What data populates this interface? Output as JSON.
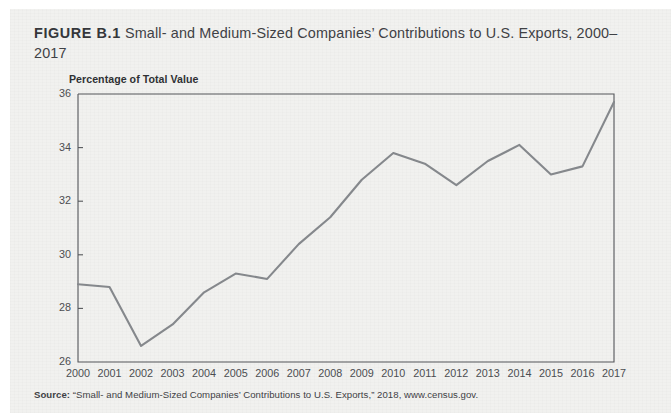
{
  "figure": {
    "number_label": "FIGURE B.1",
    "caption_text": "Small- and Medium-Sized Companies’ Contributions to U.S. Exports, 2000–2017",
    "source_label": "Source:",
    "source_text": "“Small- and Medium-Sized Companies’ Contributions to U.S. Exports,” 2018, www.census.gov."
  },
  "colors": {
    "page_background": "#f1f1ef",
    "line": "#85888c",
    "frame": "#55575b",
    "text": "#3f4145",
    "tick_text": "#4b4d51"
  },
  "chart_data": {
    "type": "line",
    "title": "Small- and Medium-Sized Companies’ Contributions to U.S. Exports, 2000–2017",
    "xlabel": "",
    "ylabel": "Percentage of Total Value",
    "axis_title": "Percentage of Total Value",
    "grid": false,
    "legend": "none",
    "xlim": [
      2000,
      2017
    ],
    "ylim": [
      26,
      36
    ],
    "ytick_step": 2,
    "ytick_labels": [
      "26",
      "28",
      "30",
      "32",
      "34",
      "36"
    ],
    "yticks": [
      26,
      28,
      30,
      32,
      34,
      36
    ],
    "categories": [
      "2000",
      "2001",
      "2002",
      "2003",
      "2004",
      "2005",
      "2006",
      "2007",
      "2008",
      "2009",
      "2010",
      "2011",
      "2012",
      "2013",
      "2014",
      "2015",
      "2016",
      "2017"
    ],
    "x": [
      2000,
      2001,
      2002,
      2003,
      2004,
      2005,
      2006,
      2007,
      2008,
      2009,
      2010,
      2011,
      2012,
      2013,
      2014,
      2015,
      2016,
      2017
    ],
    "values": [
      28.9,
      28.8,
      26.6,
      27.4,
      28.6,
      29.3,
      29.1,
      30.4,
      31.4,
      32.8,
      33.8,
      33.4,
      32.6,
      33.5,
      34.1,
      33.0,
      33.3,
      35.7
    ],
    "series": [
      {
        "name": "Percentage of Total Value",
        "values": [
          28.9,
          28.8,
          26.6,
          27.4,
          28.6,
          29.3,
          29.1,
          30.4,
          31.4,
          32.8,
          33.8,
          33.4,
          32.6,
          33.5,
          34.1,
          33.0,
          33.3,
          35.7
        ]
      }
    ]
  }
}
